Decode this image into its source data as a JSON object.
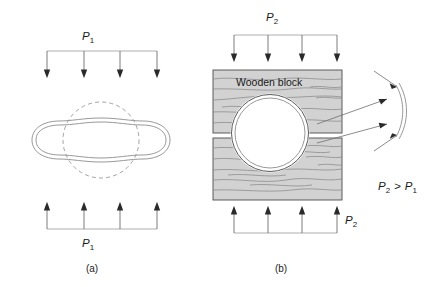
{
  "figure": {
    "title_present": false,
    "background_color": "#ffffff",
    "panels": [
      {
        "id": "a",
        "caption": "(a)",
        "pressure_symbol": "P",
        "pressure_subscript": "1",
        "top_label": "P",
        "top_label_sub": "1",
        "bottom_label": "P",
        "bottom_label_sub": "1",
        "description_items": [
          "dashed-undeformed-circle",
          "deformed-tube-cross-section",
          "four-downward-load-arrows",
          "four-upward-reaction-arrows"
        ],
        "arrow_count_top": 4,
        "arrow_count_bottom": 4
      },
      {
        "id": "b",
        "caption": "(b)",
        "pressure_symbol": "P",
        "pressure_subscript": "2",
        "top_label": "P",
        "top_label_sub": "2",
        "bottom_label": "P",
        "bottom_label_sub": "2",
        "block_label": "Wooden block",
        "description_items": [
          "upper-wooden-block",
          "lower-wooden-block",
          "cylindrical-tube-cross-section",
          "flattened-contact-detail-callout",
          "four-downward-load-arrows",
          "four-upward-reaction-arrows"
        ],
        "arrow_count_top": 4,
        "arrow_count_bottom": 4
      }
    ],
    "relation": {
      "left_symbol": "P",
      "left_sub": "2",
      "operator": ">",
      "right_symbol": "P",
      "right_sub": "1",
      "full_text": "P2 > P1"
    },
    "colors": {
      "wood_fill": "#d2d2d2",
      "wood_outline": "#4d4d4d",
      "grain": "#8a8a8a",
      "tube_wall": "#8c8c8c",
      "arrow_head": "#2a2a2a",
      "arrow_line": "#6e6e6e",
      "dashed_guide": "#9a9a9a",
      "text": "#1a1a1a"
    }
  }
}
